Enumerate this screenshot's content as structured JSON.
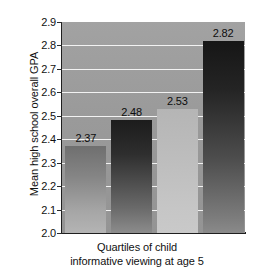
{
  "chart_data": {
    "type": "bar",
    "title": "",
    "subtitle": "",
    "xlabel_line1": "Quartiles of child",
    "xlabel_line2": "informative viewing at age 5",
    "ylabel": "Mean high school overall GPA",
    "categories": [
      "1",
      "2",
      "3",
      "4"
    ],
    "values": [
      2.37,
      2.48,
      2.53,
      2.82
    ],
    "value_labels": [
      "2.37",
      "2.48",
      "2.53",
      "2.82"
    ],
    "ylim": [
      2.0,
      2.9
    ],
    "ytick_labels": [
      "2.9",
      "2.8",
      "2.7",
      "2.6",
      "2.5",
      "2.4",
      "2.3",
      "2.2",
      "2.1",
      "2.0"
    ],
    "ytick_values": [
      2.9,
      2.8,
      2.7,
      2.6,
      2.5,
      2.4,
      2.3,
      2.2,
      2.1,
      2.0
    ],
    "ytick_step": 0.1,
    "grid": "horizontal",
    "legend": "none",
    "bar_fills": [
      "#858585",
      "#2e2e2e",
      "#bdbdbd",
      "#242424"
    ],
    "plot_background": "#9a9a9a",
    "gridline_color": "#f2f2f2",
    "axis_color": "#1f1f1f",
    "text_color": "#111111"
  }
}
